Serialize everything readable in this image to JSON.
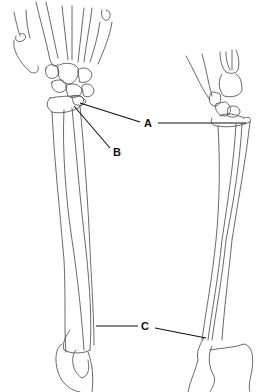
{
  "diagram": {
    "views": [
      {
        "name": "left-view",
        "description": "forearm with hand, front view"
      },
      {
        "name": "right-view",
        "description": "forearm with hand, side view"
      }
    ],
    "labels": [
      {
        "id": "A",
        "text": "A",
        "x": 144,
        "y": 119
      },
      {
        "id": "B",
        "text": "B",
        "x": 112,
        "y": 147
      },
      {
        "id": "C",
        "text": "C",
        "x": 141,
        "y": 321
      }
    ],
    "colors": {
      "line": "#444444",
      "leader": "#111111",
      "background": "#ffffff"
    }
  }
}
